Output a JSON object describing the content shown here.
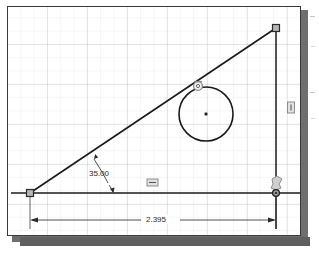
{
  "app": {
    "title": "CAD Sketch Viewer",
    "view_name": "sketch-canvas"
  },
  "sketch": {
    "entities": {
      "baseline_label": "horizontal-baseline",
      "inclined_label": "inclined-line",
      "vertical_label": "vertical-line",
      "circle_label": "sketch-circle",
      "circle_center_label": "circle-center-point"
    },
    "vertices": [
      {
        "name": "origin-vertex",
        "x": 22,
        "y": 186
      },
      {
        "name": "apex-vertex",
        "x": 268,
        "y": 21
      },
      {
        "name": "corner-vertex",
        "x": 268,
        "y": 186
      }
    ],
    "circle": {
      "cx": 198,
      "cy": 107,
      "r": 27
    }
  },
  "dimensions": {
    "angle": {
      "value": "35.00",
      "name": "angle-dimension",
      "units": "degrees"
    },
    "linear": {
      "value": "2.395",
      "name": "linear-dimension",
      "units": "inches"
    }
  },
  "constraints": [
    {
      "name": "tangent-constraint",
      "glyph": "tangent-icon",
      "x": 190,
      "y": 78
    },
    {
      "name": "horizontal-constraint",
      "glyph": "horizontal-icon",
      "x": 144,
      "y": 176
    },
    {
      "name": "vertical-constraint",
      "glyph": "vertical-icon",
      "x": 283,
      "y": 100
    },
    {
      "name": "coincident-constraint",
      "glyph": "coincident-icon",
      "x": 268,
      "y": 180
    }
  ],
  "colors": {
    "geometry": "#1a1a1a",
    "dimension": "#3b3b3b",
    "constraint": "#6b6b6b",
    "grid": "#b8c0cc",
    "frame": "#3a3a3a",
    "shadow": "#6e6e6e",
    "canvas": "#ffffff"
  }
}
